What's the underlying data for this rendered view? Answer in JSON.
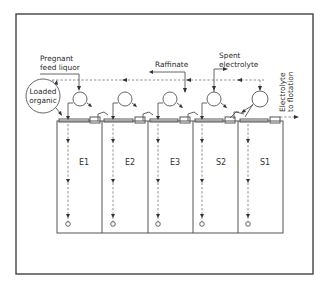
{
  "diagram": {
    "type": "solvent-extraction flowsheet",
    "labels": {
      "pregnant_feed_line1": "Pregnant",
      "pregnant_feed_line2": "feed liquor",
      "raffinate": "Raffinate",
      "spent_electrolyte_line1": "Spent",
      "spent_electrolyte_line2": "electrolyte",
      "loaded_organic_line1": "Loaded",
      "loaded_organic_line2": "organic",
      "electrolyte_out_line1": "Electrolyte",
      "electrolyte_out_line2": "to flotation"
    },
    "stages": [
      {
        "id": "E1",
        "label": "E1",
        "type": "extraction"
      },
      {
        "id": "E2",
        "label": "E2",
        "type": "extraction"
      },
      {
        "id": "E3",
        "label": "E3",
        "type": "extraction"
      },
      {
        "id": "S2",
        "label": "S2",
        "type": "stripping"
      },
      {
        "id": "S1",
        "label": "S1",
        "type": "stripping"
      }
    ],
    "colors": {
      "line": "#555555",
      "dashed_flow": "#777777",
      "text": "#2a2a2a",
      "background": "#ffffff"
    }
  }
}
